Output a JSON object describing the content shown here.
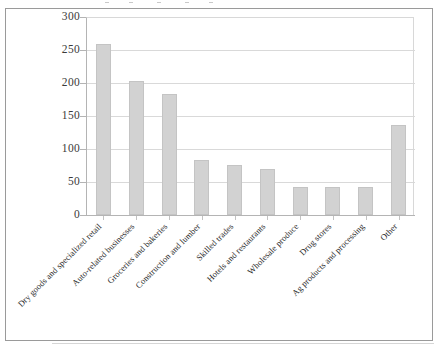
{
  "chart_data": {
    "type": "bar",
    "title": "",
    "subtitle": "",
    "xlabel": "",
    "ylabel": "",
    "ylim": [
      0,
      300
    ],
    "ytick_values": [
      0,
      50,
      100,
      150,
      200,
      250,
      300
    ],
    "ytick_labels": [
      "0",
      "50",
      "100",
      "150",
      "200",
      "250",
      "300"
    ],
    "grid": true,
    "legend": false,
    "legend_position": "none",
    "bar_color": "#d2d2d2",
    "bar_edge_color": "#c4c4c4",
    "categories": [
      "Dry goods and specialized retail",
      "Auto-related businesses",
      "Groceries and bakeries",
      "Construction and lumber",
      "Skilled trades",
      "Hotels and restaurants",
      "Wholesale produce",
      "Drug stores",
      "Ag products and processing",
      "Other"
    ],
    "values": [
      259,
      203,
      184,
      83,
      75,
      70,
      43,
      42,
      42,
      136
    ]
  },
  "axes": {
    "y_axis_name": "y-axis",
    "x_axis_name": "x-axis"
  },
  "caption": {
    "text": ""
  }
}
